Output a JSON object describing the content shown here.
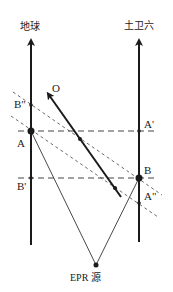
{
  "labels": {
    "earth": "地球",
    "titan": "土卫六",
    "A": "A",
    "A_prime": "A'",
    "A_dprime": "A\"",
    "B": "B",
    "B_prime": "B'",
    "B_dprime": "B\"",
    "O": "O",
    "source": "EPR 源"
  },
  "colors": {
    "line": "#1a1a1a",
    "dashed": "#444444"
  }
}
